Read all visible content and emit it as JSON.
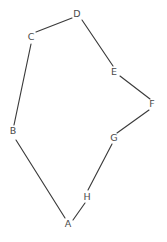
{
  "diagram": {
    "background_color": "#ffffff",
    "edge_color": "#3b3b3b",
    "label_color": "#4a4a4a",
    "width": 167,
    "height": 242
  },
  "chart_data": {
    "type": "diagram",
    "graph_type": "cycle",
    "directed": false,
    "node_count": 8,
    "edge_count": 8,
    "title": "",
    "nodes": [
      {
        "id": "A",
        "label": "A",
        "x": 68,
        "y": 224
      },
      {
        "id": "B",
        "label": "B",
        "x": 13,
        "y": 131
      },
      {
        "id": "C",
        "label": "C",
        "x": 31,
        "y": 37
      },
      {
        "id": "D",
        "label": "D",
        "x": 77,
        "y": 14
      },
      {
        "id": "E",
        "label": "E",
        "x": 114,
        "y": 72
      },
      {
        "id": "F",
        "label": "F",
        "x": 152,
        "y": 104
      },
      {
        "id": "G",
        "label": "G",
        "x": 114,
        "y": 138
      },
      {
        "id": "H",
        "label": "H",
        "x": 87,
        "y": 197
      }
    ],
    "edges": [
      {
        "from": "A",
        "to": "B",
        "x1": 65,
        "y1": 218,
        "x2": 16,
        "y2": 140
      },
      {
        "from": "B",
        "to": "C",
        "x1": 14,
        "y1": 125,
        "x2": 31,
        "y2": 44
      },
      {
        "from": "C",
        "to": "D",
        "x1": 36,
        "y1": 32,
        "x2": 72,
        "y2": 18
      },
      {
        "from": "D",
        "to": "E",
        "x1": 82,
        "y1": 20,
        "x2": 113,
        "y2": 66
      },
      {
        "from": "E",
        "to": "F",
        "x1": 120,
        "y1": 76,
        "x2": 150,
        "y2": 99
      },
      {
        "from": "F",
        "to": "G",
        "x1": 149,
        "y1": 110,
        "x2": 117,
        "y2": 133
      },
      {
        "from": "G",
        "to": "H",
        "x1": 112,
        "y1": 144,
        "x2": 88,
        "y2": 190
      },
      {
        "from": "H",
        "to": "A",
        "x1": 85,
        "y1": 203,
        "x2": 73,
        "y2": 220
      }
    ]
  }
}
